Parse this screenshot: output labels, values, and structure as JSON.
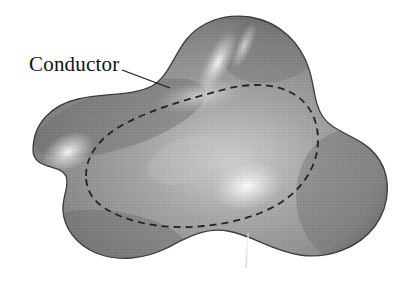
{
  "figure": {
    "background_color": "#ffffff",
    "width": 411,
    "height": 295
  },
  "labels": {
    "conductor": "Conductor"
  },
  "annotations": {
    "leader_line": {
      "name": "leader-line",
      "from_x": 122,
      "from_y": 70,
      "to_x": 170,
      "to_y": 88,
      "color": "#1a1a1a",
      "width": 1.2
    }
  },
  "shapes": {
    "conductor_body": {
      "name": "conductor-blob",
      "fill_mid": "#8e8e8e",
      "fill_dark": "#5d5d5d",
      "fill_edge": "#4a4a4a",
      "outline_color": "#3a3a3a",
      "outline_width": 1.3
    },
    "gaussian_surface": {
      "name": "gaussian-surface-dashed-curve",
      "stroke_color": "#232323",
      "stroke_width": 1.8,
      "dash_pattern": "7 5",
      "fill": "none"
    },
    "bottom_notch": {
      "name": "bottom-notch",
      "fill": "#ffffff",
      "tip_x": 248,
      "tip_y": 231,
      "base_y": 295
    },
    "highlights": [
      {
        "name": "highlight-left-lobe",
        "cx": 68,
        "cy": 152,
        "rx": 26,
        "ry": 17,
        "color": "#f2f2f2"
      },
      {
        "name": "highlight-top-lobe",
        "cx": 218,
        "cy": 62,
        "rx": 13,
        "ry": 34,
        "rotate": 28,
        "color": "#f4f4f4"
      },
      {
        "name": "highlight-center-right",
        "cx": 247,
        "cy": 186,
        "rx": 34,
        "ry": 22,
        "color": "#f6f6f6"
      },
      {
        "name": "highlight-upper-mid",
        "cx": 200,
        "cy": 96,
        "rx": 46,
        "ry": 16,
        "color": "#d9d9d9"
      }
    ]
  },
  "colors": {
    "background": "#ffffff",
    "ink": "#131313",
    "blob_mid_gray": "#8e8e8e",
    "blob_dark_gray": "#565656",
    "dash_gray": "#232323"
  }
}
